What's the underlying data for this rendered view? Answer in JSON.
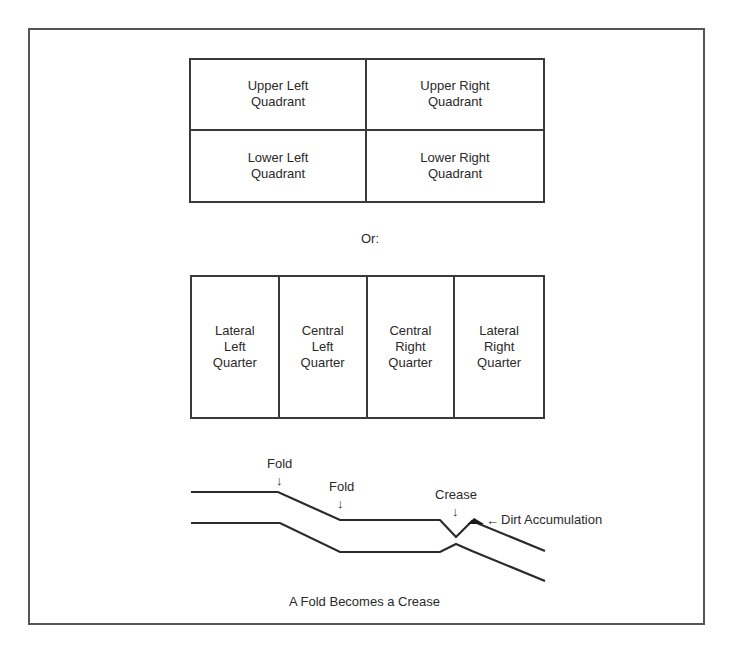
{
  "quadrant_grid": {
    "cells": [
      {
        "label": "Upper Left\nQuadrant"
      },
      {
        "label": "Upper Right\nQuadrant"
      },
      {
        "label": "Lower Left\nQuadrant"
      },
      {
        "label": "Lower Right\nQuadrant"
      }
    ]
  },
  "separator": {
    "label": "Or:"
  },
  "quarter_grid": {
    "cells": [
      {
        "label": "Lateral\nLeft\nQuarter"
      },
      {
        "label": "Central\nLeft\nQuarter"
      },
      {
        "label": "Central\nRight\nQuarter"
      },
      {
        "label": "Lateral\nRight\nQuarter"
      }
    ]
  },
  "fold_diagram": {
    "labels": {
      "fold_1": "Fold",
      "fold_2": "Fold",
      "crease": "Crease",
      "dirt": "Dirt Accumulation"
    },
    "arrows": {
      "down": "↓",
      "left": "←"
    },
    "caption": "A Fold Becomes a Crease",
    "line_color": "#2a2a2a"
  }
}
